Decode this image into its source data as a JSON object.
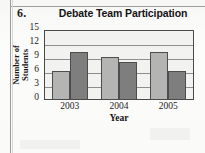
{
  "question_number": "6.",
  "chart_data": {
    "type": "bar",
    "title": "Debate Team Participation",
    "xlabel": "Year",
    "ylabel_lines": [
      "Number of",
      "Students"
    ],
    "ylabel": "Number of Students",
    "categories": [
      "2003",
      "2004",
      "2005"
    ],
    "yticks": [
      "0",
      "3",
      "6",
      "9",
      "12",
      "15"
    ],
    "ylim": [
      0,
      15
    ],
    "grid": true,
    "legend": "none",
    "series": [
      {
        "name": "series-1",
        "color": "#b4b4b2",
        "values": [
          6,
          9,
          10
        ]
      },
      {
        "name": "series-2",
        "color": "#7e7e7e",
        "values": [
          10,
          8,
          6
        ]
      }
    ]
  },
  "colors": {
    "series_light": "#b4b4b2",
    "series_dark": "#7e7e7e",
    "plot_background": "#f2f2f0",
    "plot_border": "#4a4a4a",
    "gridline": "#8e8e8e",
    "page_background": "#fbfbfa",
    "text": "#141414"
  }
}
